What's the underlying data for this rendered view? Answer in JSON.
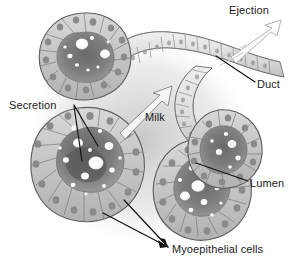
{
  "figure": {
    "background_color": "#ffffff",
    "text_color": "#1b1b1b",
    "width": 292,
    "height": 264
  },
  "labels": {
    "ejection": "Ejection",
    "duct": "Duct",
    "secretion": "Secretion",
    "milk": "Milk",
    "lumen": "Lumen",
    "myoepithelial_cells": "Myoepithelial cells"
  },
  "icons": {
    "ejection_arrow": "arrow-up-right-outline-icon",
    "milk_arrow": "arrow-up-right-outline-icon",
    "duct_leader": "leader-line-icon",
    "lumen_leader": "leader-line-icon",
    "secretion_leader_upper": "leader-line-icon",
    "secretion_leader_lower": "leader-line-icon",
    "myo_leader_left": "leader-line-icon",
    "myo_leader_right": "leader-line-icon"
  },
  "structures": {
    "alveolus_lobes": [
      "upper-left-lobe",
      "lower-left-lobe",
      "lower-right-lobe",
      "right-lobe"
    ],
    "duct_tube": "duct-tube",
    "epithelial_cell_layer": "epithelial-cells",
    "lumen_cavity": "lumen-cavity",
    "milk_droplets": "milk-droplets"
  },
  "palette": {
    "outline": "#5d5d5d",
    "cell_fill": "#c9c9c9",
    "cell_fill_dark": "#a8a8a8",
    "nucleus": "#8a8a8a",
    "lumen_fill": "#777777",
    "lumen_fill_dark": "#5f5f5f",
    "droplet": "#ffffff",
    "duct_fill": "#e0e0e0",
    "arrow_stroke": "#b0b0b0"
  }
}
